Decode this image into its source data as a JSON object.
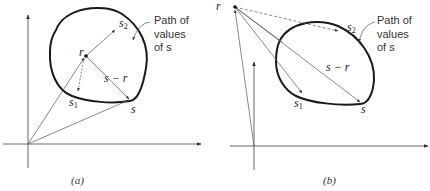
{
  "figure": {
    "panels": [
      {
        "id": "a",
        "caption": "(a)",
        "labels": {
          "r": "r",
          "s": "s",
          "s1_base": "s",
          "s1_sub": "1",
          "s2_base": "s",
          "s2_sub": "2",
          "diff": "s − r"
        },
        "annotation": [
          "Path of",
          "values",
          "of s"
        ]
      },
      {
        "id": "b",
        "caption": "(b)",
        "labels": {
          "r": "r",
          "s": "s",
          "s1_base": "s",
          "s1_sub": "1",
          "s2_base": "s",
          "s2_sub": "2",
          "diff": "s − r"
        },
        "annotation": [
          "Path of",
          "values",
          "of s"
        ]
      }
    ],
    "colors": {
      "curve": "#1a1a1a",
      "vector": "#555555",
      "axis": "#444444"
    }
  }
}
